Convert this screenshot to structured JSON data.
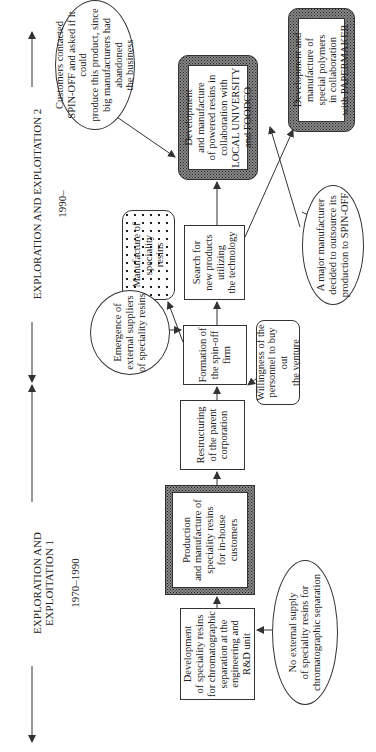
{
  "periods": [
    {
      "title": "EXPLORATION AND EXPLOITATION 1",
      "years": "1970–1990"
    },
    {
      "title": "EXPLORATION AND EXPLOITATION 2",
      "years": "1990–"
    }
  ],
  "nodes": {
    "dev_rnd": "Development\nof speciality resins\nfor chromatographic\nseparation at the\nengineering and\nR&D unit",
    "production": "Production\nand manufacture of\nspeciality resins\nfor in-house\ncustomers",
    "restructuring": "Restructuring\nof  the parent\ncorporation",
    "formation": "Formation of\nthe spin-off\nfirm",
    "search": "Search for\nnew products\nutilizing\nthe technology",
    "manufacture": "Manufacture of\nspeciality\nresins",
    "dev_powdered": "Development\nand manufacture\nof  powered resins in\ncollaboration with\nLOCAL UNIVERSITY\nand FOODCO",
    "dev_polymers": "Development and\nmanufacture of\nspecial polymers\nin collaboration\nwith PAPERMAKER"
  },
  "drivers": {
    "no_external": "No external supply\nof speciality resins for\nchromatographic separation",
    "emergence": "Emergence of\nexternal suppliers\nof speciality resins",
    "willingness": "Willingness of the\npersonnel to buy out\nthe venture",
    "customers": "Customers contacted\nSPIN-OFF and asked if it could\nproduce this product, since\nbig manufacturers had abandoned\nthe business",
    "major_manufacturer": "A major manufacturer\ndecided to outsource its\nproduction to SPIN-OFF"
  },
  "colors": {
    "line": "#333333",
    "texture": "#888888",
    "background": "#ffffff"
  }
}
